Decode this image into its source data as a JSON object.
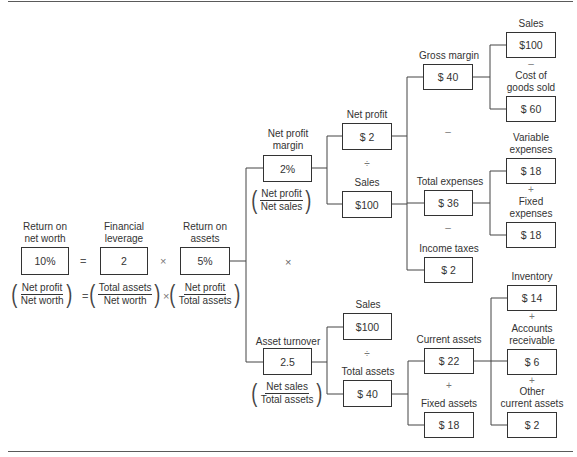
{
  "diagram": {
    "type": "financial-ratio-tree (DuPont analysis)",
    "level0": {
      "return_on_net_worth": {
        "label": "Return on\nnet worth",
        "value": "10%",
        "formula": {
          "num": "Net profit",
          "den": "Net worth"
        }
      },
      "equals": "=",
      "financial_leverage": {
        "label": "Financial\nleverage",
        "value": "2",
        "formula": {
          "num": "Total assets",
          "den": "Net worth"
        }
      },
      "times1": "×",
      "return_on_assets": {
        "label": "Return on\nassets",
        "value": "5%",
        "formula": {
          "num": "Net profit",
          "den": "Total assets"
        }
      }
    },
    "level1": {
      "net_profit_margin": {
        "label": "Net profit\nmargin",
        "value": "2%",
        "formula": {
          "num": "Net profit",
          "den": "Net sales"
        }
      },
      "times2": "×",
      "asset_turnover": {
        "label": "Asset turnover",
        "value": "2.5",
        "formula": {
          "num": "Net sales",
          "den": "Total assets"
        }
      }
    },
    "level2": {
      "net_profit": {
        "label": "Net profit",
        "value": "$ 2"
      },
      "divide1": "÷",
      "sales_a": {
        "label": "Sales",
        "value": "$100"
      },
      "sales_b": {
        "label": "Sales",
        "value": "$100"
      },
      "divide2": "÷",
      "total_assets": {
        "label": "Total assets",
        "value": "$ 40"
      }
    },
    "level3": {
      "gross_margin": {
        "label": "Gross margin",
        "value": "$ 40"
      },
      "minus1": "–",
      "total_expenses": {
        "label": "Total expenses",
        "value": "$ 36"
      },
      "minus2": "–",
      "income_taxes": {
        "label": "Income taxes",
        "value": "$ 2"
      },
      "current_assets": {
        "label": "Current assets",
        "value": "$ 22"
      },
      "plus1": "+",
      "fixed_assets": {
        "label": "Fixed assets",
        "value": "$ 18"
      }
    },
    "level4": {
      "sales": {
        "label": "Sales",
        "value": "$100"
      },
      "minus3": "–",
      "cogs": {
        "label": "Cost of\ngoods sold",
        "value": "$ 60"
      },
      "variable_expenses": {
        "label": "Variable\nexpenses",
        "value": "$ 18"
      },
      "plus2": "+",
      "fixed_expenses": {
        "label": "Fixed\nexpenses",
        "value": "$ 18"
      },
      "inventory": {
        "label": "Inventory",
        "value": "$ 14"
      },
      "plus3": "+",
      "accounts_receivable": {
        "label": "Accounts\nreceivable",
        "value": "$ 6"
      },
      "plus4": "+",
      "other_current_assets": {
        "label": "Other\ncurrent assets",
        "value": "$ 2"
      }
    },
    "colors": {
      "line": "#333333",
      "text": "#333333",
      "background": "#ffffff"
    }
  }
}
